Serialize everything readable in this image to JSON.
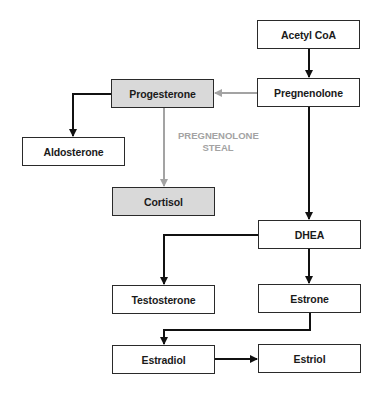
{
  "diagram": {
    "colors": {
      "box_border": "#2a2a2a",
      "box_fill": "#ffffff",
      "shaded_fill": "#d9d9d9",
      "arrow_black": "#111111",
      "arrow_gray": "#a3a3a3",
      "steal_label": "#a3a3a3"
    },
    "nodes": {
      "acetyl_coa": {
        "label": "Acetyl CoA",
        "shaded": false
      },
      "pregnenolone": {
        "label": "Pregnenolone",
        "shaded": false
      },
      "progesterone": {
        "label": "Progesterone",
        "shaded": true
      },
      "aldosterone": {
        "label": "Aldosterone",
        "shaded": false
      },
      "cortisol": {
        "label": "Cortisol",
        "shaded": true
      },
      "dhea": {
        "label": "DHEA",
        "shaded": false
      },
      "testosterone": {
        "label": "Testosterone",
        "shaded": false
      },
      "estrone": {
        "label": "Estrone",
        "shaded": false
      },
      "estradiol": {
        "label": "Estradiol",
        "shaded": false
      },
      "estriol": {
        "label": "Estriol",
        "shaded": false
      }
    },
    "annotations": {
      "steal_line1": "PREGNENOLONE",
      "steal_line2": "STEAL"
    },
    "edges": [
      {
        "from": "Acetyl CoA",
        "to": "Pregnenolone",
        "color": "black"
      },
      {
        "from": "Pregnenolone",
        "to": "Progesterone",
        "color": "gray"
      },
      {
        "from": "Progesterone",
        "to": "Aldosterone",
        "color": "black"
      },
      {
        "from": "Progesterone",
        "to": "Cortisol",
        "color": "gray"
      },
      {
        "from": "Pregnenolone",
        "to": "DHEA",
        "color": "black"
      },
      {
        "from": "DHEA",
        "to": "Testosterone",
        "color": "black"
      },
      {
        "from": "DHEA",
        "to": "Estrone",
        "color": "black"
      },
      {
        "from": "Estrone",
        "to": "Estradiol",
        "color": "black"
      },
      {
        "from": "Estradiol",
        "to": "Estriol",
        "color": "black"
      }
    ]
  }
}
